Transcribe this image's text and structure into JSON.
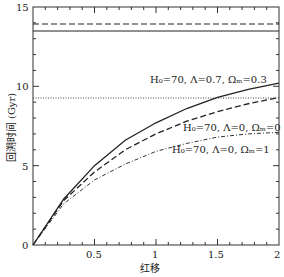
{
  "chart_data": {
    "type": "line",
    "xlabel": "红移",
    "ylabel": "回溯时间 (Gyr)",
    "xlim": [
      0,
      2
    ],
    "ylim": [
      0,
      15
    ],
    "xticks": [
      "0.5",
      "1",
      "1.5",
      "2"
    ],
    "yticks": [
      "0",
      "5",
      "10",
      "15"
    ],
    "series": [
      {
        "name": "H0=70, Λ=0.7, Ωm=0.3",
        "style": "solid",
        "x": [
          0,
          0.25,
          0.5,
          0.75,
          1,
          1.25,
          1.5,
          1.75,
          2
        ],
        "values": [
          0,
          2.9,
          5.0,
          6.6,
          7.7,
          8.6,
          9.3,
          9.8,
          10.2
        ],
        "asymptote": 13.5
      },
      {
        "name": "H0=70, Λ=0, Ωm=0",
        "style": "dashed",
        "x": [
          0,
          0.25,
          0.5,
          0.75,
          1,
          1.25,
          1.5,
          1.75,
          2
        ],
        "values": [
          0,
          2.8,
          4.6,
          6.0,
          7.0,
          7.8,
          8.4,
          8.9,
          9.3
        ],
        "asymptote": 13.9
      },
      {
        "name": "H0=70, Λ=0, Ωm=1",
        "style": "dotdash",
        "x": [
          0,
          0.25,
          0.5,
          0.75,
          1,
          1.25,
          1.5,
          1.75,
          2
        ],
        "values": [
          0,
          2.6,
          4.1,
          5.1,
          5.9,
          6.4,
          6.8,
          7.0,
          7.1
        ],
        "asymptote": 9.3
      }
    ]
  },
  "labels": {
    "s1": "H₀=70, Λ=0.7, Ωₘ=0.3",
    "s2": "H₀=70, Λ=0, Ωₘ=0",
    "s3": "H₀=70, Λ=0, Ωₘ=1",
    "x": "红移",
    "y": "回溯时间 (Gyr)",
    "t0": "0",
    "t05": "0.5",
    "t1": "1",
    "t15": "1.5",
    "t2": "2",
    "y0": "0",
    "y5": "5",
    "y10": "10",
    "y15": "15"
  }
}
